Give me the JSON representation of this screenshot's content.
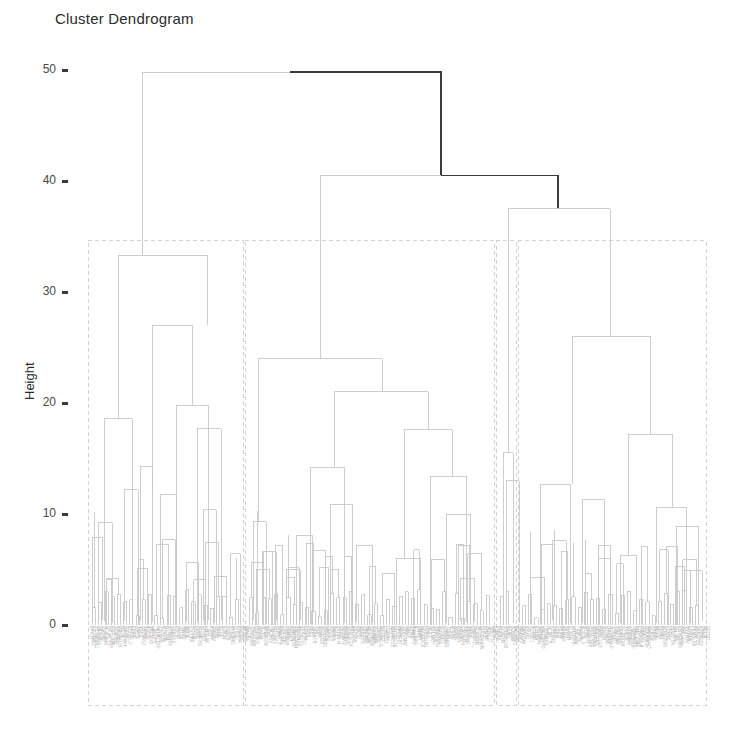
{
  "chart_data": {
    "type": "dendrogram",
    "title": "Cluster Dendrogram",
    "xlabel": "",
    "ylabel": "Height",
    "ylim": [
      0,
      52
    ],
    "yticks": [
      0,
      10,
      20,
      30,
      40,
      50
    ],
    "ytick_labels": [
      "0",
      "10",
      "20",
      "30",
      "40",
      "50"
    ],
    "grid": false,
    "legend": "none",
    "n_leaves": 260,
    "leaf_labels_readable": false,
    "leaf_label_note": "dense unreadable micro-text band of sample labels along baseline",
    "colors": {
      "highlight_branch": "#3b3b3b",
      "default_branch": "#c9c9c9",
      "cluster_box": "#d2d2d2",
      "axis_text": "#4a4a4a",
      "title_text": "#2b2b2b"
    },
    "cluster_boxes": [
      {
        "name": "cluster-1",
        "x0": 88,
        "x1": 243,
        "height_top": 34.6
      },
      {
        "name": "cluster-2",
        "x0": 245,
        "x1": 494,
        "height_top": 34.6
      },
      {
        "name": "cluster-3",
        "x0": 496,
        "x1": 516,
        "height_top": 34.6
      },
      {
        "name": "cluster-4",
        "x0": 518,
        "x1": 706,
        "height_top": 34.6
      }
    ],
    "merges": [
      {
        "id": "root",
        "height": 49.8,
        "x_left": 142,
        "x_right": 441,
        "emphasis": "dark"
      },
      {
        "id": "node-40",
        "height": 40.5,
        "x_left": 320,
        "x_right": 558,
        "emphasis": "dark"
      },
      {
        "id": "right-root",
        "height": 37.5,
        "x_left": 508,
        "x_right": 610,
        "emphasis": "light"
      },
      {
        "id": "left-root",
        "height": 33.3,
        "x_left": 118,
        "x_right": 207,
        "emphasis": "light"
      },
      {
        "id": "left-n27",
        "height": 27.0,
        "x_left": 152,
        "x_right": 192,
        "emphasis": "light"
      },
      {
        "id": "right-n26",
        "height": 26.0,
        "x_left": 572,
        "x_right": 650,
        "emphasis": "light"
      },
      {
        "id": "mid-root",
        "height": 24.0,
        "x_left": 258,
        "x_right": 382,
        "emphasis": "light"
      },
      {
        "id": "mid-n21",
        "height": 21.0,
        "x_left": 334,
        "x_right": 428,
        "emphasis": "light"
      },
      {
        "id": "left-n20",
        "height": 19.8,
        "x_left": 176,
        "x_right": 208,
        "emphasis": "light"
      },
      {
        "id": "left-n19",
        "height": 18.6,
        "x_left": 104,
        "x_right": 132,
        "emphasis": "light"
      },
      {
        "id": "left-n18",
        "height": 17.7,
        "x_left": 197,
        "x_right": 221,
        "emphasis": "light"
      },
      {
        "id": "mid-n18",
        "height": 17.6,
        "x_left": 404,
        "x_right": 452,
        "emphasis": "light"
      },
      {
        "id": "right-n17",
        "height": 17.2,
        "x_left": 628,
        "x_right": 672,
        "emphasis": "light"
      },
      {
        "id": "c3-n15",
        "height": 15.5,
        "x_left": 503,
        "x_right": 513,
        "emphasis": "light"
      },
      {
        "id": "left-n14",
        "height": 14.3,
        "x_left": 140,
        "x_right": 152,
        "emphasis": "light"
      },
      {
        "id": "mid-n14",
        "height": 14.2,
        "x_left": 310,
        "x_right": 344,
        "emphasis": "light"
      },
      {
        "id": "mid-n13",
        "height": 13.4,
        "x_left": 430,
        "x_right": 466,
        "emphasis": "light"
      },
      {
        "id": "c3-n13",
        "height": 13.0,
        "x_left": 506,
        "x_right": 519,
        "emphasis": "light"
      },
      {
        "id": "right-n12",
        "height": 12.7,
        "x_left": 540,
        "x_right": 570,
        "emphasis": "light"
      },
      {
        "id": "left-n12",
        "height": 12.2,
        "x_left": 124,
        "x_right": 138,
        "emphasis": "light"
      },
      {
        "id": "left-n11",
        "height": 11.8,
        "x_left": 160,
        "x_right": 176,
        "emphasis": "light"
      },
      {
        "id": "right-n11",
        "height": 11.3,
        "x_left": 582,
        "x_right": 604,
        "emphasis": "light"
      },
      {
        "id": "mid-n11",
        "height": 10.9,
        "x_left": 330,
        "x_right": 352,
        "emphasis": "light"
      },
      {
        "id": "right-n10",
        "height": 10.6,
        "x_left": 656,
        "x_right": 686,
        "emphasis": "light"
      },
      {
        "id": "left-n10",
        "height": 10.4,
        "x_left": 203,
        "x_right": 216,
        "emphasis": "light"
      },
      {
        "id": "mid-n10",
        "height": 10.0,
        "x_left": 446,
        "x_right": 470,
        "emphasis": "light"
      },
      {
        "id": "left-n9",
        "height": 9.2,
        "x_left": 98,
        "x_right": 112,
        "emphasis": "light"
      },
      {
        "id": "mid-n9",
        "height": 9.3,
        "x_left": 253,
        "x_right": 266,
        "emphasis": "light"
      },
      {
        "id": "right-n9",
        "height": 8.9,
        "x_left": 676,
        "x_right": 698,
        "emphasis": "light"
      },
      {
        "id": "left-n8",
        "height": 7.9,
        "x_left": 92,
        "x_right": 102,
        "emphasis": "light"
      },
      {
        "id": "mid-n8",
        "height": 8.1,
        "x_left": 296,
        "x_right": 312,
        "emphasis": "light"
      },
      {
        "id": "right-n8",
        "height": 7.6,
        "x_left": 552,
        "x_right": 566,
        "emphasis": "light"
      },
      {
        "id": "mid-n7",
        "height": 7.2,
        "x_left": 356,
        "x_right": 372,
        "emphasis": "light"
      },
      {
        "id": "mid-n6",
        "height": 6.6,
        "x_left": 262,
        "x_right": 276,
        "emphasis": "light"
      },
      {
        "id": "mid-n6b",
        "height": 6.0,
        "x_left": 396,
        "x_right": 420,
        "emphasis": "light"
      },
      {
        "id": "right-n6",
        "height": 6.3,
        "x_left": 620,
        "x_right": 636,
        "emphasis": "light"
      },
      {
        "id": "left-n6",
        "height": 5.6,
        "x_left": 186,
        "x_right": 198,
        "emphasis": "light"
      },
      {
        "id": "mid-n5",
        "height": 5.0,
        "x_left": 286,
        "x_right": 300,
        "emphasis": "light"
      },
      {
        "id": "right-n5",
        "height": 4.9,
        "x_left": 690,
        "x_right": 702,
        "emphasis": "light"
      },
      {
        "id": "left-n4",
        "height": 4.4,
        "x_left": 214,
        "x_right": 226,
        "emphasis": "light"
      },
      {
        "id": "mid-n4",
        "height": 4.2,
        "x_left": 460,
        "x_right": 474,
        "emphasis": "light"
      },
      {
        "id": "right-n4",
        "height": 4.3,
        "x_left": 530,
        "x_right": 544,
        "emphasis": "light"
      }
    ]
  },
  "axes": {
    "y_title": "Height",
    "tick_labels": [
      "50",
      "40",
      "30",
      "20",
      "10",
      "0"
    ]
  },
  "plot": {
    "title": "Cluster Dendrogram"
  }
}
